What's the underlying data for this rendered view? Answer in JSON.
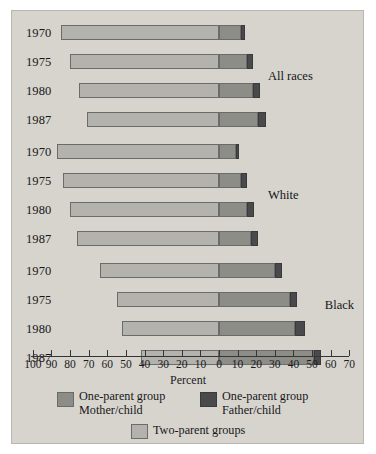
{
  "chart_data": {
    "type": "bar",
    "orientation": "horizontal",
    "subtype": "diverging-stacked",
    "title": "",
    "xlabel": "Percent",
    "ylabel": "",
    "grid": false,
    "legend_position": "bottom",
    "axis": {
      "tick_labels": [
        "100",
        "90",
        "80",
        "70",
        "60",
        "50",
        "40",
        "30",
        "20",
        "10",
        "0",
        "10",
        "20",
        "30",
        "40",
        "50",
        "60",
        "70"
      ],
      "tick_values": [
        -100,
        -90,
        -80,
        -70,
        -60,
        -50,
        -40,
        -30,
        -20,
        -10,
        0,
        10,
        20,
        30,
        40,
        50,
        60,
        70
      ],
      "zero_value": 0,
      "left_max": 100,
      "right_max": 70
    },
    "series": [
      {
        "name": "Two-parent groups",
        "color": "#b3b2ac",
        "side": "left"
      },
      {
        "name": "One-parent group Mother/child",
        "color": "#8d8d88",
        "side": "right"
      },
      {
        "name": "One-parent group Father/child",
        "color": "#4a4a4c",
        "side": "right"
      }
    ],
    "groups": [
      {
        "label": "All races",
        "rows": [
          {
            "year": "1970",
            "two_parent": 85,
            "mother_child": 12,
            "father_child": 2
          },
          {
            "year": "1975",
            "two_parent": 80,
            "mother_child": 15,
            "father_child": 3
          },
          {
            "year": "1980",
            "two_parent": 75,
            "mother_child": 18,
            "father_child": 4
          },
          {
            "year": "1987",
            "two_parent": 71,
            "mother_child": 21,
            "father_child": 4
          }
        ]
      },
      {
        "label": "White",
        "rows": [
          {
            "year": "1970",
            "two_parent": 87,
            "mother_child": 9,
            "father_child": 2
          },
          {
            "year": "1975",
            "two_parent": 84,
            "mother_child": 12,
            "father_child": 3
          },
          {
            "year": "1980",
            "two_parent": 80,
            "mother_child": 15,
            "father_child": 4
          },
          {
            "year": "1987",
            "two_parent": 76,
            "mother_child": 17,
            "father_child": 4
          }
        ]
      },
      {
        "label": "Black",
        "rows": [
          {
            "year": "1970",
            "two_parent": 64,
            "mother_child": 30,
            "father_child": 4
          },
          {
            "year": "1975",
            "two_parent": 55,
            "mother_child": 38,
            "father_child": 4
          },
          {
            "year": "1980",
            "two_parent": 52,
            "mother_child": 41,
            "father_child": 5
          },
          {
            "year": "1987",
            "two_parent": 42,
            "mother_child": 51,
            "father_child": 4
          }
        ]
      }
    ]
  },
  "axis_title": "Percent",
  "legend": {
    "items": [
      {
        "swatch_color": "#8d8d88",
        "line1": "One-parent group",
        "line2": "Mother/child"
      },
      {
        "swatch_color": "#4a4a4c",
        "line1": "One-parent group",
        "line2": "Father/child"
      },
      {
        "swatch_color": "#b3b2ac",
        "line1": "Two-parent groups",
        "line2": ""
      }
    ]
  },
  "colors": {
    "plate_background": "#d6d4cd",
    "two_parent": "#b3b2ac",
    "mother_child": "#8d8d88",
    "father_child": "#4a4a4c",
    "bar_outline": "#6b6b6b",
    "axis": "#353535",
    "text": "#17171a"
  }
}
